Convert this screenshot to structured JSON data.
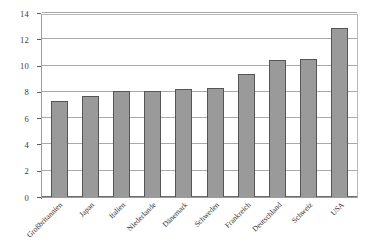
{
  "chart_data": {
    "type": "bar",
    "title": "",
    "subtitle": "",
    "xlabel": "",
    "ylabel": "",
    "ylim": [
      0,
      14
    ],
    "ytick_step": 2,
    "yticks": [
      0,
      2,
      4,
      6,
      8,
      10,
      12,
      14
    ],
    "ytick_labels": [
      "0",
      "2",
      "4",
      "6",
      "8",
      "10",
      "12",
      "14"
    ],
    "grid": "horizontal",
    "legend": "none",
    "bar_color": "#9a9a9a",
    "bar_border_color": "#555555",
    "gridline_color": "#a9a9a9",
    "axis_color": "#5e5e5e",
    "categories": [
      "Großbritannien",
      "Japan",
      "Italien",
      "Niederlande",
      "Dänemark",
      "Schweden",
      "Frankreich",
      "Deutschland",
      "Schweiz",
      "USA"
    ],
    "values": [
      7.3,
      7.7,
      8.05,
      8.05,
      8.2,
      8.3,
      9.35,
      10.45,
      10.5,
      12.85
    ],
    "series": [
      {
        "name": "",
        "values": [
          7.3,
          7.7,
          8.05,
          8.05,
          8.2,
          8.3,
          9.35,
          10.45,
          10.5,
          12.85
        ]
      }
    ]
  }
}
